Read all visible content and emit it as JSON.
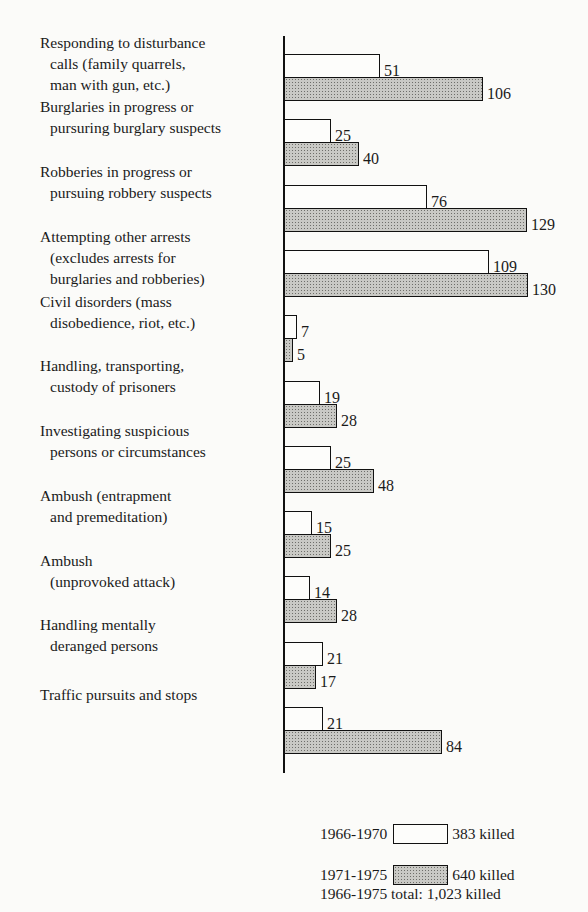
{
  "chart_data": {
    "type": "bar",
    "orientation": "horizontal",
    "title": "",
    "xlabel": "",
    "ylabel": "",
    "grid": false,
    "legend_position": "bottom-right",
    "categories": [
      "Responding to disturbance calls (family quarrels, man with gun, etc.)",
      "Burglaries in progress or pursuing burglary suspects",
      "Robberies in progress or pursuing robbery suspects",
      "Attempting other arrests (excludes arrests for burglaries and robberies)",
      "Civil disorders (mass disobedience, riot, etc.)",
      "Handling, transporting, custody of prisoners",
      "Investigating suspicious persons or circumstances",
      "Ambush (entrapment and premeditation)",
      "Ambush (unprovoked attack)",
      "Handling mentally deranged persons",
      "Traffic pursuits and stops"
    ],
    "series": [
      {
        "name": "1966-1970",
        "style": "white",
        "values": [
          51,
          25,
          76,
          109,
          7,
          19,
          25,
          15,
          14,
          21,
          21
        ]
      },
      {
        "name": "1971-1975",
        "style": "shaded",
        "values": [
          106,
          40,
          129,
          130,
          5,
          28,
          48,
          25,
          28,
          17,
          84
        ]
      }
    ],
    "xlim": [
      0,
      140
    ]
  },
  "rows": [
    {
      "lines": [
        "Responding to disturbance",
        "calls (family quarrels,",
        "man with gun, etc.)"
      ]
    },
    {
      "lines": [
        "Burglaries in progress or",
        "pursuring burglary suspects"
      ]
    },
    {
      "lines": [
        "Robberies in progress or",
        "pursuing robbery suspects"
      ]
    },
    {
      "lines": [
        "Attempting other arrests",
        "(excludes arrests for",
        "burglaries and robberies)"
      ]
    },
    {
      "lines": [
        "Civil disorders (mass",
        "disobedience, riot, etc.)"
      ]
    },
    {
      "lines": [
        "Handling, transporting,",
        "custody of prisoners"
      ]
    },
    {
      "lines": [
        "Investigating suspicious",
        "persons or circumstances"
      ]
    },
    {
      "lines": [
        "Ambush (entrapment",
        "and premeditation)"
      ]
    },
    {
      "lines": [
        "Ambush",
        "(unprovoked attack)"
      ]
    },
    {
      "lines": [
        "Handling mentally",
        "deranged persons"
      ]
    },
    {
      "lines": [
        "Traffic pursuits and stops"
      ]
    }
  ],
  "legend": {
    "series1_period": "1966-1970",
    "series1_total": "383 killed",
    "series2_period": "1971-1975",
    "series2_total": "640 killed",
    "grand_total": "1966-1975 total: 1,023 killed"
  }
}
